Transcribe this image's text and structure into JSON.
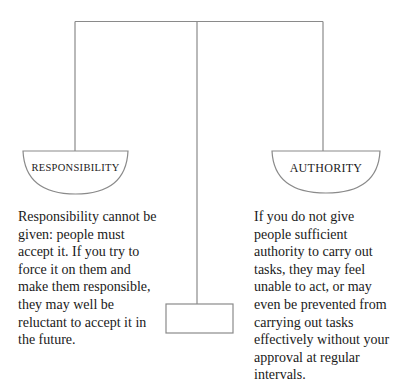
{
  "diagram": {
    "type": "balance-scale",
    "colors": {
      "line": "#8a8a8a",
      "text": "#1a1a1a"
    },
    "left_pan": {
      "label": "RESPONSIBILITY",
      "text": "Responsibility cannot be given: people must accept it. If you try to force it on them and make them responsible, they may well be reluctant to accept it in the future.",
      "lines": [
        "Responsibility cannot be",
        "given: people must",
        "accept it. If you try to",
        "force it on them and",
        "make them responsible,",
        "they may well be",
        "reluctant to accept it in",
        "the future."
      ]
    },
    "right_pan": {
      "label": "AUTHORITY",
      "text": "If you do not give people sufficient authority to carry out tasks, they may feel unable to act, or may even be prevented from carrying out tasks effectively without your approval at regular intervals.",
      "lines": [
        "If you do not give",
        "people sufficient",
        "authority to carry out",
        "tasks, they may feel",
        "unable to act, or may",
        "even be prevented from",
        "carrying out tasks",
        "effectively without your",
        "approval at regular",
        "intervals."
      ]
    }
  }
}
